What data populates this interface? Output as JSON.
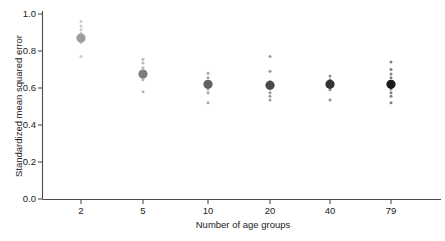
{
  "chart_data": {
    "type": "scatter",
    "title": "",
    "xlabel": "Number of age groups",
    "ylabel": "Standardized mean squared error",
    "categories": [
      "2",
      "5",
      "10",
      "20",
      "40",
      "79"
    ],
    "xtick_labels": [
      "2",
      "5",
      "10",
      "20",
      "40",
      "79"
    ],
    "ytick_labels": [
      "0.0",
      "0.2",
      "0.4",
      "0.6",
      "0.8",
      "1.0"
    ],
    "ylim": [
      0.0,
      1.0
    ],
    "ytick_values": [
      0.0,
      0.2,
      0.4,
      0.6,
      0.8,
      1.0
    ],
    "grid": false,
    "legend": "none",
    "series": [
      {
        "name": "mean standardized mean squared error",
        "marker": "large-dot",
        "categories": [
          "2",
          "5",
          "10",
          "20",
          "40",
          "79"
        ],
        "values": [
          0.87,
          0.675,
          0.62,
          0.615,
          0.62,
          0.62
        ]
      },
      {
        "name": "individual replicate values",
        "marker": "small-dot",
        "points": [
          {
            "category": "2",
            "values": [
              0.96,
              0.935,
              0.915,
              0.895,
              0.875,
              0.845,
              0.77
            ]
          },
          {
            "category": "5",
            "values": [
              0.755,
              0.735,
              0.71,
              0.69,
              0.665,
              0.645,
              0.58
            ]
          },
          {
            "category": "10",
            "values": [
              0.68,
              0.655,
              0.635,
              0.615,
              0.595,
              0.575,
              0.52
            ]
          },
          {
            "category": "20",
            "values": [
              0.77,
              0.69,
              0.635,
              0.615,
              0.595,
              0.575,
              0.555,
              0.535
            ]
          },
          {
            "category": "40",
            "values": [
              0.665,
              0.645,
              0.625,
              0.605,
              0.59,
              0.535
            ]
          },
          {
            "category": "79",
            "values": [
              0.74,
              0.7,
              0.675,
              0.655,
              0.635,
              0.615,
              0.595,
              0.575,
              0.555,
              0.52
            ]
          }
        ]
      }
    ],
    "series_colors": [
      "#9e9e9e",
      "#7d7d7d",
      "#616161",
      "#4a4a4a",
      "#333333",
      "#1c1c1c"
    ]
  }
}
